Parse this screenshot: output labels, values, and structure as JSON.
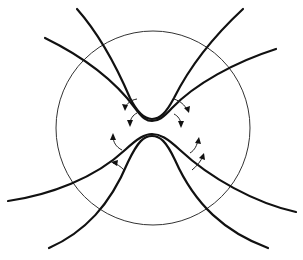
{
  "diagram": {
    "title": "",
    "background": "#ffffff",
    "stroke_color": "#111111",
    "circle": {
      "cx": 153,
      "cy": 128,
      "r": 97
    },
    "curves": [
      {
        "name": "upper-outer-curve",
        "d": "M45,38 C90,60 118,85 135,108 C143,119 147,121 152,121 C158,121 163,118 172,108 C195,84 235,62 276,49"
      },
      {
        "name": "upper-inner-curve",
        "d": "M77,9 C100,35 118,70 130,98 C138,114 145,119 152,119 C160,119 166,113 174,98 C190,66 215,35 243,9"
      },
      {
        "name": "lower-outer-curve",
        "d": "M8,201 C50,195 95,178 125,150 C138,138 145,134 152,134 C160,134 167,138 180,150 C210,178 255,203 296,212"
      },
      {
        "name": "lower-inner-curve",
        "d": "M49,248 C85,232 110,205 128,162 C138,141 144,136 152,136 C160,136 166,141 175,160 C195,205 225,232 268,248"
      }
    ],
    "arrows": [
      {
        "name": "arrow-upper-left-1",
        "arc": "M137,99 C131,100 127,103 125,108",
        "head": "125,111 122,104 128,105"
      },
      {
        "name": "arrow-upper-left-2",
        "arc": "M137,113 C133,115 130,119 130,124",
        "head": "130,127 127,120 133,120"
      },
      {
        "name": "arrow-upper-right-1",
        "arc": "M174,99 C180,101 185,105 187,110",
        "head": "189,113 184,108 190,106"
      },
      {
        "name": "arrow-upper-right-2",
        "arc": "M174,114 C178,116 181,120 181,125",
        "head": "181,128 178,121 184,121"
      },
      {
        "name": "arrow-lower-left-1",
        "arc": "M122,150 C116,147 113,142 113,136",
        "head": "113,133 110,140 116,140"
      },
      {
        "name": "arrow-lower-left-2",
        "arc": "M124,170 C120,166 117,164 113,163",
        "head": "111,162 118,160 117,166"
      },
      {
        "name": "arrow-lower-right-1",
        "arc": "M190,153 C195,150 197,145 198,140",
        "head": "199,137 195,143 201,144"
      },
      {
        "name": "arrow-lower-right-2",
        "arc": "M192,170 C197,166 201,161 203,156",
        "head": "204,153 199,158 205,160"
      }
    ]
  }
}
